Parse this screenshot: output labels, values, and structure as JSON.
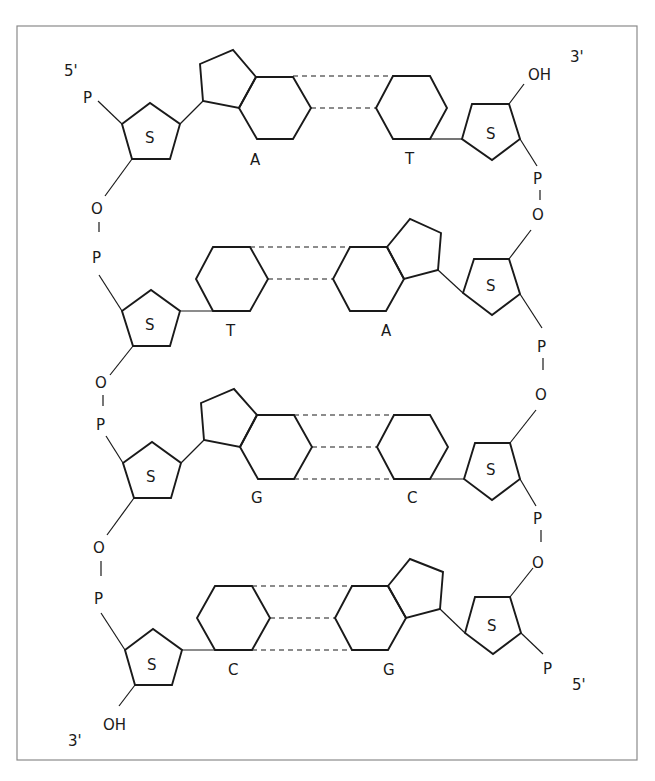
{
  "diagram": {
    "ends": {
      "left_top": "5'",
      "right_top": "3'",
      "left_bottom": "3'",
      "right_bottom": "5'"
    },
    "groups": {
      "phosphate": "P",
      "oxygen": "O",
      "hydroxyl": "OH",
      "sugar": "S"
    },
    "base_pairs": [
      {
        "left": "A",
        "right": "T",
        "hydrogen_bonds": 2
      },
      {
        "left": "T",
        "right": "A",
        "hydrogen_bonds": 2
      },
      {
        "left": "G",
        "right": "C",
        "hydrogen_bonds": 3
      },
      {
        "left": "C",
        "right": "G",
        "hydrogen_bonds": 3
      }
    ],
    "colors": {
      "line": "#1a1a1a",
      "frame": "#8a8a8a",
      "background": "#ffffff"
    }
  }
}
